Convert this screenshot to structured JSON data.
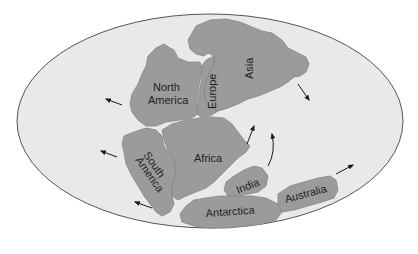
{
  "map": {
    "type": "paleogeographic reconstruction (Pangaea)",
    "colors": {
      "background": "#ffffff",
      "ocean": "#e9e9e9",
      "land": "#9b9b9b",
      "outline": "#555555",
      "text": "#1e1e1e"
    },
    "labels": {
      "north_america_line1": "North",
      "north_america_line2": "America",
      "europe": "Europe",
      "asia": "Asia",
      "south_america_line1": "South",
      "south_america_line2": "America",
      "africa": "Africa",
      "india": "India",
      "antarctica": "Antarctica",
      "australia": "Australia"
    },
    "arrows": [
      {
        "name": "north-america-drift",
        "direction": "west-northwest"
      },
      {
        "name": "south-america-drift-upper",
        "direction": "west-northwest"
      },
      {
        "name": "south-america-drift-lower",
        "direction": "west-northwest"
      },
      {
        "name": "asia-drift",
        "direction": "southeast"
      },
      {
        "name": "africa-drift",
        "direction": "north-northeast"
      },
      {
        "name": "india-drift",
        "direction": "north (curved)"
      },
      {
        "name": "australia-drift",
        "direction": "east-northeast"
      }
    ]
  }
}
